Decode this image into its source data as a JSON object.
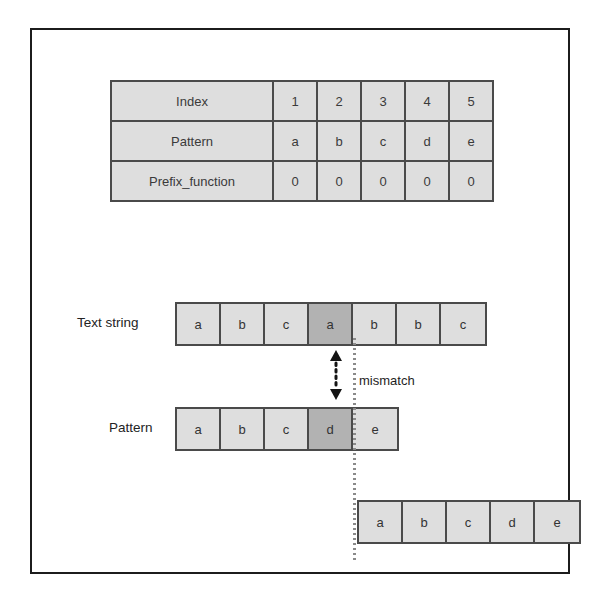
{
  "diagram": {
    "colors": {
      "cell_fill": "#dedede",
      "cell_highlight": "#b2b2b2",
      "cell_border": "#4a4a4a",
      "frame_border": "#1c1c1c",
      "dotted_line": "#8a8a8a"
    }
  },
  "prefix_table": {
    "rows": [
      {
        "label": "Index",
        "values": [
          "1",
          "2",
          "3",
          "4",
          "5"
        ]
      },
      {
        "label": "Pattern",
        "values": [
          "a",
          "b",
          "c",
          "d",
          "e"
        ]
      },
      {
        "label": "Prefix_function",
        "values": [
          "0",
          "0",
          "0",
          "0",
          "0"
        ]
      }
    ]
  },
  "text_string": {
    "label": "Text string",
    "cells": [
      {
        "char": "a",
        "highlight": false
      },
      {
        "char": "b",
        "highlight": false
      },
      {
        "char": "c",
        "highlight": false
      },
      {
        "char": "a",
        "highlight": true
      },
      {
        "char": "b",
        "highlight": false
      },
      {
        "char": "b",
        "highlight": false
      },
      {
        "char": "c",
        "highlight": false
      }
    ]
  },
  "pattern_row": {
    "label": "Pattern",
    "cells": [
      {
        "char": "a",
        "highlight": false
      },
      {
        "char": "b",
        "highlight": false
      },
      {
        "char": "c",
        "highlight": false
      },
      {
        "char": "d",
        "highlight": true
      },
      {
        "char": "e",
        "highlight": false
      }
    ]
  },
  "shifted_pattern": {
    "cells": [
      {
        "char": "a",
        "highlight": false
      },
      {
        "char": "b",
        "highlight": false
      },
      {
        "char": "c",
        "highlight": false
      },
      {
        "char": "d",
        "highlight": false
      },
      {
        "char": "e",
        "highlight": false
      }
    ]
  },
  "annotations": {
    "mismatch_label": "mismatch",
    "mismatch_arrow_icon": "double-headed-vertical-dotted-arrow-icon",
    "alignment_line_icon": "vertical-dotted-line-icon"
  }
}
